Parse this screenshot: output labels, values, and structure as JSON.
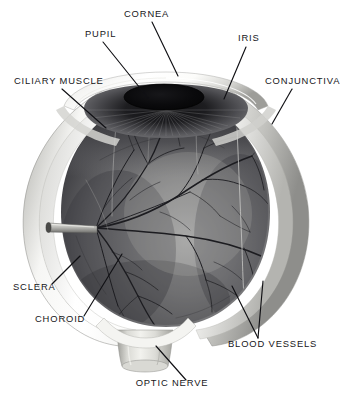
{
  "figure": {
    "background_color": "#ffffff",
    "label_color": "#16161a",
    "leader_line_color": "#101014"
  },
  "labels": [
    {
      "id": "cornea",
      "text": "CORNEA",
      "x": 124,
      "y": 17,
      "anchor": "start"
    },
    {
      "id": "pupil",
      "text": "PUPIL",
      "x": 85,
      "y": 37,
      "anchor": "start"
    },
    {
      "id": "iris",
      "text": "IRIS",
      "x": 238,
      "y": 41,
      "anchor": "start"
    },
    {
      "id": "ciliary-muscle",
      "text": "CILIARY MUSCLE",
      "x": 14,
      "y": 84,
      "anchor": "start"
    },
    {
      "id": "conjunctiva",
      "text": "CONJUNCTIVA",
      "x": 265,
      "y": 84,
      "anchor": "start"
    },
    {
      "id": "sclera",
      "text": "SCLERA",
      "x": 13,
      "y": 290,
      "anchor": "start"
    },
    {
      "id": "choroid",
      "text": "CHOROID",
      "x": 35,
      "y": 322,
      "anchor": "start"
    },
    {
      "id": "blood-vessels",
      "text": "BLOOD VESSELS",
      "x": 228,
      "y": 347,
      "anchor": "start"
    },
    {
      "id": "optic-nerve",
      "text": "OPTIC NERVE",
      "x": 172,
      "y": 386,
      "anchor": "middle"
    }
  ],
  "colors": {
    "sclera_light": "#fbfbfa",
    "sclera_shadow": "#a9a9a6",
    "sclera_mid": "#d8d8d4",
    "choroid_dark": "#2a2a2c",
    "choroid_mid": "#6e6e70",
    "choroid_light": "#9a9a9a",
    "iris_dark": "#232327",
    "pupil": "#08080a",
    "vessel": "#1b1b1e",
    "optic_nerve": "#cfcfca"
  }
}
